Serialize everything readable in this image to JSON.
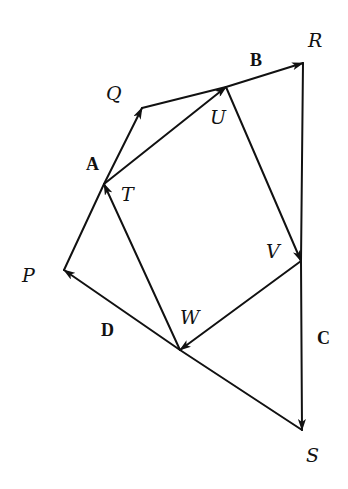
{
  "diagram": {
    "points": {
      "P": {
        "label": "P",
        "x": 64,
        "y": 270,
        "label_x": 22,
        "label_y": 282
      },
      "Q": {
        "label": "Q",
        "x": 142,
        "y": 108,
        "label_x": 106,
        "label_y": 100
      },
      "R": {
        "label": "R",
        "x": 303,
        "y": 63,
        "label_x": 308,
        "label_y": 47
      },
      "S": {
        "label": "S",
        "x": 302,
        "y": 430,
        "label_x": 306,
        "label_y": 462
      },
      "T": {
        "label": "T",
        "x": 104,
        "y": 184,
        "label_x": 121,
        "label_y": 201
      },
      "U": {
        "label": "U",
        "x": 226,
        "y": 87,
        "label_x": 210,
        "label_y": 124
      },
      "V": {
        "label": "V",
        "x": 301,
        "y": 261,
        "label_x": 266,
        "label_y": 258
      },
      "W": {
        "label": "W",
        "x": 180,
        "y": 350,
        "label_x": 180,
        "label_y": 324
      }
    },
    "vector_labels": [
      {
        "label": "A",
        "x": 86,
        "y": 170
      },
      {
        "label": "B",
        "x": 250,
        "y": 66
      },
      {
        "label": "C",
        "x": 317,
        "y": 344
      },
      {
        "label": "D",
        "x": 101,
        "y": 336
      }
    ],
    "outer_quadrilateral": [
      "P",
      "Q",
      "R",
      "S"
    ],
    "inner_quadrilateral": [
      "T",
      "U",
      "V",
      "W"
    ],
    "arrows": [
      {
        "from": "T",
        "to": "Q",
        "name": "A"
      },
      {
        "from": "U",
        "to": "R",
        "name": "B"
      },
      {
        "from": "V",
        "to": "S",
        "name": "C"
      },
      {
        "from": "W",
        "to": "P",
        "name": "D"
      },
      {
        "from": "T",
        "to": "U"
      },
      {
        "from": "U",
        "to": "V"
      },
      {
        "from": "V",
        "to": "W"
      },
      {
        "from": "W",
        "to": "T"
      }
    ],
    "plain_segments": [
      {
        "from": "P",
        "to": "T"
      },
      {
        "from": "Q",
        "to": "U"
      },
      {
        "from": "R",
        "to": "V"
      },
      {
        "from": "S",
        "to": "W"
      }
    ],
    "stroke_color": "#111111",
    "background": "#ffffff"
  }
}
